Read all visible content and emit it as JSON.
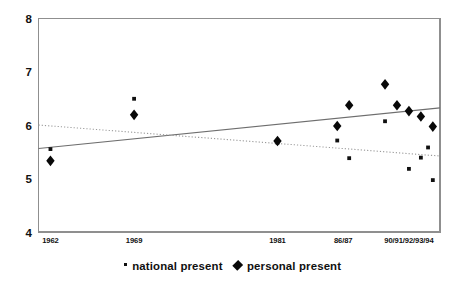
{
  "chart_data": {
    "type": "scatter",
    "title": "",
    "subtitle": "",
    "xlabel": "",
    "ylabel": "",
    "ylim": [
      4,
      8
    ],
    "yticks": [
      4,
      5,
      6,
      7,
      8
    ],
    "ytick_labels": [
      "4",
      "5",
      "6",
      "7",
      "8"
    ],
    "xtick_labels": [
      "1962",
      "1969",
      "1981",
      "86/87",
      "90/91/92/93/94"
    ],
    "xtick_positions": [
      1962,
      1969,
      1981,
      1986.5,
      1992
    ],
    "xlim": [
      1961,
      1994.6
    ],
    "grid": false,
    "legend_position": "bottom-center",
    "legend": [
      {
        "name": "national present",
        "marker": "small-square"
      },
      {
        "name": "personal present",
        "marker": "diamond"
      }
    ],
    "series": [
      {
        "name": "national present",
        "marker": "small-square",
        "points": [
          {
            "x": 1962,
            "y": 5.55
          },
          {
            "x": 1969,
            "y": 6.49
          },
          {
            "x": 1981,
            "y": 5.67
          },
          {
            "x": 1986,
            "y": 5.71
          },
          {
            "x": 1987,
            "y": 5.38
          },
          {
            "x": 1990,
            "y": 6.07
          },
          {
            "x": 1992,
            "y": 5.18
          },
          {
            "x": 1993,
            "y": 5.39
          },
          {
            "x": 1993.6,
            "y": 5.58
          },
          {
            "x": 1994,
            "y": 4.97
          }
        ]
      },
      {
        "name": "personal present",
        "marker": "diamond",
        "points": [
          {
            "x": 1962,
            "y": 5.33
          },
          {
            "x": 1969,
            "y": 6.19
          },
          {
            "x": 1981,
            "y": 5.7
          },
          {
            "x": 1986,
            "y": 5.98
          },
          {
            "x": 1987,
            "y": 6.37
          },
          {
            "x": 1990,
            "y": 6.76
          },
          {
            "x": 1991,
            "y": 6.37
          },
          {
            "x": 1992,
            "y": 6.26
          },
          {
            "x": 1993,
            "y": 6.16
          },
          {
            "x": 1994,
            "y": 5.97
          }
        ]
      }
    ],
    "trendlines": [
      {
        "name": "personal present trend",
        "style": "solid",
        "x_start": 1961,
        "y_start": 5.56,
        "x_end": 1994.6,
        "y_end": 6.32
      },
      {
        "name": "national present trend",
        "style": "dotted",
        "x_start": 1961,
        "y_start": 6.0,
        "x_end": 1994.6,
        "y_end": 5.42
      }
    ]
  },
  "axis": {
    "y_labels": [
      "8",
      "7",
      "6",
      "5",
      "4"
    ],
    "x_labels": [
      "1962",
      "1969",
      "1981",
      "86/87",
      "90/91/92/93/94"
    ]
  },
  "legend": {
    "national_label": "national present",
    "personal_label": "personal present"
  }
}
